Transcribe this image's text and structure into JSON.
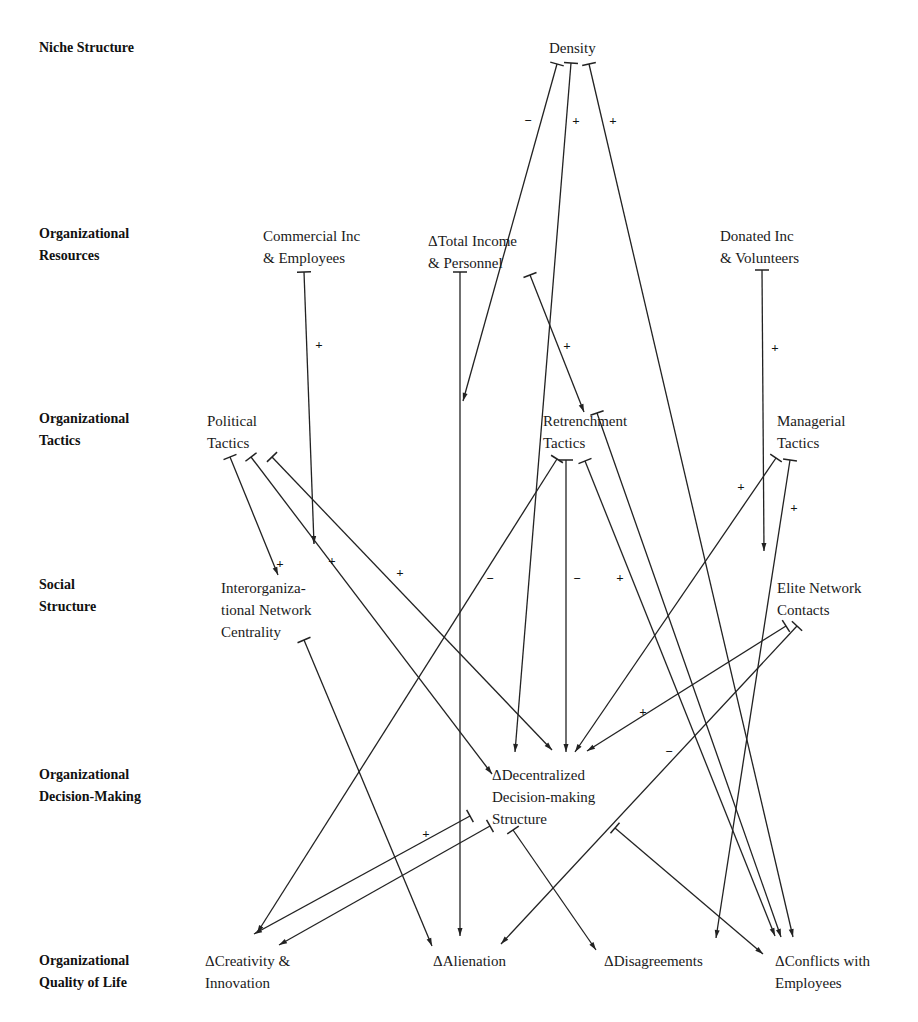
{
  "diagram": {
    "rows": [
      {
        "id": "niche",
        "label": "Niche Structure",
        "x": 39,
        "y": 37
      },
      {
        "id": "resources",
        "label": "Organizational\nResources",
        "x": 39,
        "y": 223
      },
      {
        "id": "tactics",
        "label": "Organizational\nTactics",
        "x": 39,
        "y": 408
      },
      {
        "id": "social",
        "label": "Social\nStructure",
        "x": 39,
        "y": 574
      },
      {
        "id": "decision",
        "label": "Organizational\nDecision-Making",
        "x": 39,
        "y": 764
      },
      {
        "id": "quality",
        "label": "Organizational\nQuality of Life",
        "x": 39,
        "y": 950
      }
    ],
    "nodes": [
      {
        "id": "density",
        "label": "Density",
        "x": 549,
        "y": 37
      },
      {
        "id": "commercial",
        "label": "Commercial Inc\n& Employees",
        "x": 263,
        "y": 225
      },
      {
        "id": "total_income",
        "label": "ΔTotal Income\n& Personnel",
        "x": 428,
        "y": 230
      },
      {
        "id": "donated",
        "label": "Donated Inc\n& Volunteers",
        "x": 720,
        "y": 225
      },
      {
        "id": "political",
        "label": "Political\nTactics",
        "x": 207,
        "y": 410
      },
      {
        "id": "retrenchment",
        "label": "Retrenchment\nTactics",
        "x": 543,
        "y": 410
      },
      {
        "id": "managerial",
        "label": "Managerial\nTactics",
        "x": 777,
        "y": 410
      },
      {
        "id": "interorg",
        "label": "Interorganiza-\ntional Network\nCentrality",
        "x": 221,
        "y": 577
      },
      {
        "id": "elite",
        "label": "Elite Network\nContacts",
        "x": 777,
        "y": 577
      },
      {
        "id": "decentralized",
        "label": "ΔDecentralized\n Decision-making\n Structure",
        "x": 492,
        "y": 764
      },
      {
        "id": "creativity",
        "label": "ΔCreativity &\nInnovation",
        "x": 205,
        "y": 950
      },
      {
        "id": "alienation",
        "label": "ΔAlienation",
        "x": 433,
        "y": 950
      },
      {
        "id": "disagreements",
        "label": "ΔDisagreements",
        "x": 604,
        "y": 950
      },
      {
        "id": "conflicts",
        "label": "ΔConflicts with\nEmployees",
        "x": 775,
        "y": 950
      }
    ],
    "edges": [
      {
        "from": "density",
        "to": "total_income_link",
        "x1": 557,
        "y1": 64,
        "x2": 463,
        "y2": 401,
        "sign": "−",
        "sx": 528,
        "sy": 120
      },
      {
        "from": "density",
        "to": "decentralized",
        "x1": 571,
        "y1": 63,
        "x2": 515,
        "y2": 752,
        "sign": "+",
        "sx": 576,
        "sy": 120
      },
      {
        "from": "density",
        "to": "conflicts",
        "x1": 589,
        "y1": 64,
        "x2": 793,
        "y2": 937,
        "sign": "+",
        "sx": 613,
        "sy": 120
      },
      {
        "from": "commercial",
        "to": "interorg_link",
        "x1": 304,
        "y1": 272,
        "x2": 314,
        "y2": 544,
        "sign": "+",
        "sx": 319,
        "sy": 344
      },
      {
        "from": "total_income",
        "to": "alienation",
        "x1": 460,
        "y1": 272,
        "x2": 460,
        "y2": 936,
        "sign": "",
        "sx": 0,
        "sy": 0
      },
      {
        "from": "total_income",
        "to": "retrenchment",
        "x1": 530,
        "y1": 275,
        "x2": 584,
        "y2": 412,
        "sign": "+",
        "sx": 567,
        "sy": 345
      },
      {
        "from": "donated",
        "to": "elite_link",
        "x1": 762,
        "y1": 270,
        "x2": 764,
        "y2": 551,
        "sign": "+",
        "sx": 775,
        "sy": 347
      },
      {
        "from": "political",
        "to": "interorg",
        "x1": 230,
        "y1": 457,
        "x2": 278,
        "y2": 575,
        "sign": "+",
        "sx": 280,
        "sy": 563
      },
      {
        "from": "political",
        "to": "conflicts",
        "x1": 251,
        "y1": 457,
        "x2": 492,
        "y2": 774,
        "sign": "+",
        "sx": 332,
        "sy": 560
      },
      {
        "from": "political",
        "to": "decentralized",
        "x1": 272,
        "y1": 457,
        "x2": 552,
        "y2": 750,
        "sign": "+",
        "sx": 400,
        "sy": 572
      },
      {
        "from": "retrenchment",
        "to": "creativity",
        "x1": 557,
        "y1": 459,
        "x2": 257,
        "y2": 933,
        "sign": "−",
        "sx": 490,
        "sy": 578
      },
      {
        "from": "retrenchment",
        "to": "decentralized",
        "x1": 566,
        "y1": 460,
        "x2": 566,
        "y2": 752,
        "sign": "−",
        "sx": 577,
        "sy": 578
      },
      {
        "from": "retrenchment",
        "to": "conflicts",
        "x1": 585,
        "y1": 461,
        "x2": 775,
        "y2": 936,
        "sign": "+",
        "sx": 620,
        "sy": 577
      },
      {
        "from": "managerial",
        "to": "decentralized",
        "x1": 776,
        "y1": 458,
        "x2": 575,
        "y2": 752,
        "sign": "+",
        "sx": 741,
        "sy": 486
      },
      {
        "from": "managerial",
        "to": "disagreements",
        "x1": 790,
        "y1": 460,
        "x2": 716,
        "y2": 938,
        "sign": "+",
        "sx": 794,
        "sy": 507
      },
      {
        "from": "interorg",
        "to": "alienation",
        "x1": 304,
        "y1": 640,
        "x2": 432,
        "y2": 946,
        "sign": "",
        "sx": 0,
        "sy": 0
      },
      {
        "from": "elite",
        "to": "decentralized",
        "x1": 786,
        "y1": 626,
        "x2": 587,
        "y2": 751,
        "sign": "+",
        "sx": 643,
        "sy": 711
      },
      {
        "from": "elite",
        "to": "alienation",
        "x1": 797,
        "y1": 626,
        "x2": 501,
        "y2": 944,
        "sign": "−",
        "sx": 669,
        "sy": 751
      },
      {
        "from": "decentralized",
        "to": "creativity",
        "x1": 470,
        "y1": 816,
        "x2": 254,
        "y2": 934,
        "sign": "+",
        "sx": 426,
        "sy": 833
      },
      {
        "from": "decentralized",
        "to": "creativity_2",
        "x1": 490,
        "y1": 826,
        "x2": 279,
        "y2": 945,
        "sign": "",
        "sx": 0,
        "sy": 0
      },
      {
        "from": "decentralized",
        "to": "disagreements",
        "x1": 513,
        "y1": 830,
        "x2": 596,
        "y2": 950,
        "sign": "",
        "sx": 0,
        "sy": 0
      },
      {
        "from": "decentralized",
        "to": "conflicts",
        "x1": 615,
        "y1": 828,
        "x2": 763,
        "y2": 954,
        "sign": "",
        "sx": 0,
        "sy": 0
      },
      {
        "from": "political_link",
        "to": "conflicts",
        "x1": 597,
        "y1": 413,
        "x2": 781,
        "y2": 937,
        "sign": "",
        "sx": 0,
        "sy": 0
      }
    ]
  }
}
